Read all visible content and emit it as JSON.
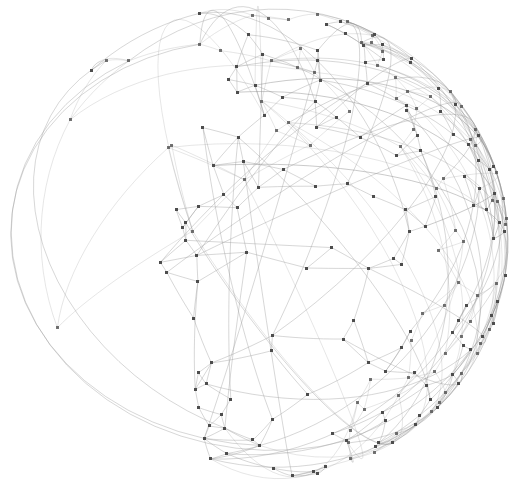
{
  "figure": {
    "title": "",
    "subtitle": "",
    "caption": "",
    "background_color": "#ffffff",
    "width": 516,
    "height": 491
  },
  "chart_data": {
    "type": "scatter",
    "title": "",
    "subtitle": "",
    "xlabel": "",
    "ylabel": "",
    "legend": [],
    "legend_position": "none",
    "grid": false,
    "axes_visible": false,
    "tick_labels_x": [],
    "tick_labels_y": [],
    "xlim": [
      0,
      516
    ],
    "ylim": [
      0,
      491
    ],
    "projection": "orthographic",
    "sphere": {
      "center_x": 259,
      "center_y": 243,
      "radius_x": 249,
      "radius_y": 237,
      "clipped_top": true,
      "clip_top_y": 0
    },
    "style": {
      "node_color": "#4d4d4d",
      "node_size_px": 3,
      "node_shape": "square",
      "edge_color": "#9a9a9a",
      "edge_width_px": 0.55,
      "edge_opacity": 0.72,
      "edge_curvature": "great-circle arc",
      "limb_edge_color": "#8a8a8a"
    },
    "counts": {
      "nodes": 214,
      "edges": 430
    },
    "sphere_points": [
      [
        0.72,
        0.34,
        0.6
      ],
      [
        -0.18,
        0.52,
        0.83
      ],
      [
        0.41,
        -0.66,
        0.63
      ],
      [
        -0.77,
        0.11,
        0.63
      ],
      [
        0.05,
        0.89,
        0.45
      ],
      [
        0.63,
        0.21,
        -0.75
      ],
      [
        -0.44,
        -0.38,
        0.81
      ],
      [
        0.88,
        -0.12,
        0.46
      ],
      [
        -0.29,
        0.74,
        -0.61
      ],
      [
        0.16,
        -0.93,
        0.33
      ],
      [
        -0.91,
        0.36,
        0.21
      ],
      [
        0.55,
        0.55,
        0.63
      ],
      [
        -0.61,
        -0.72,
        0.33
      ],
      [
        0.34,
        0.08,
        0.94
      ],
      [
        -0.05,
        -0.45,
        -0.89
      ],
      [
        0.79,
        0.58,
        0.2
      ],
      [
        -0.39,
        0.22,
        0.89
      ],
      [
        0.22,
        0.67,
        -0.71
      ],
      [
        -0.83,
        -0.25,
        0.5
      ],
      [
        0.68,
        -0.48,
        0.56
      ],
      [
        0.11,
        0.31,
        0.94
      ],
      [
        -0.52,
        0.81,
        0.26
      ],
      [
        0.93,
        0.13,
        0.34
      ],
      [
        -0.14,
        -0.77,
        0.62
      ],
      [
        0.47,
        0.86,
        -0.21
      ],
      [
        -0.66,
        0.44,
        0.61
      ],
      [
        0.28,
        -0.21,
        0.94
      ],
      [
        -0.97,
        0.05,
        0.24
      ],
      [
        0.59,
        -0.79,
        0.13
      ],
      [
        0.02,
        0.96,
        -0.28
      ],
      [
        -0.33,
        -0.59,
        0.74
      ],
      [
        0.81,
        0.41,
        -0.42
      ],
      [
        -0.72,
        0.63,
        0.29
      ],
      [
        0.39,
        0.47,
        0.79
      ],
      [
        -0.08,
        -0.15,
        0.99
      ],
      [
        0.66,
        0.72,
        0.21
      ],
      [
        -0.45,
        0.09,
        0.89
      ],
      [
        0.19,
        -0.56,
        0.81
      ],
      [
        -0.88,
        -0.44,
        0.18
      ],
      [
        0.51,
        0.18,
        0.84
      ],
      [
        -0.25,
        0.88,
        0.4
      ],
      [
        0.74,
        -0.31,
        0.6
      ],
      [
        0.08,
        0.42,
        -0.9
      ],
      [
        -0.58,
        -0.81,
        0.09
      ],
      [
        0.36,
        0.91,
        0.21
      ],
      [
        -0.95,
        0.27,
        0.16
      ],
      [
        0.62,
        -0.63,
        0.47
      ],
      [
        -0.11,
        0.67,
        0.73
      ],
      [
        0.85,
        0.05,
        -0.52
      ],
      [
        -0.41,
        -0.28,
        0.87
      ],
      [
        0.24,
        0.79,
        0.56
      ],
      [
        -0.69,
        0.19,
        0.7
      ],
      [
        0.44,
        -0.88,
        0.18
      ],
      [
        -0.02,
        -0.34,
        0.94
      ],
      [
        0.92,
        0.33,
        0.21
      ],
      [
        -0.31,
        0.52,
        0.79
      ],
      [
        0.57,
        0.67,
        -0.48
      ],
      [
        -0.79,
        -0.56,
        0.25
      ],
      [
        0.13,
        0.22,
        0.97
      ],
      [
        -0.51,
        0.77,
        0.38
      ],
      [
        0.71,
        -0.16,
        -0.68
      ],
      [
        -0.21,
        -0.91,
        0.36
      ],
      [
        0.33,
        0.61,
        0.72
      ],
      [
        -0.86,
        0.41,
        0.3
      ],
      [
        0.48,
        -0.45,
        0.75
      ],
      [
        0.06,
        0.93,
        0.36
      ],
      [
        -0.63,
        -0.13,
        0.77
      ],
      [
        0.77,
        0.52,
        0.37
      ],
      [
        -0.38,
        0.31,
        0.87
      ],
      [
        0.29,
        -0.72,
        0.63
      ],
      [
        -0.99,
        0.08,
        0.11
      ],
      [
        0.65,
        0.75,
        0.12
      ],
      [
        -0.17,
        -0.49,
        0.85
      ],
      [
        0.54,
        0.28,
        0.79
      ],
      [
        -0.74,
        0.66,
        0.14
      ],
      [
        0.41,
        0.88,
        -0.25
      ],
      [
        0.09,
        -0.82,
        0.56
      ],
      [
        -0.46,
        -0.67,
        0.58
      ],
      [
        0.83,
        -0.39,
        0.4
      ],
      [
        -0.26,
        0.96,
        0.09
      ],
      [
        0.68,
        0.12,
        0.72
      ],
      [
        -0.91,
        -0.31,
        0.27
      ],
      [
        0.18,
        0.48,
        0.86
      ],
      [
        -0.56,
        0.44,
        0.7
      ],
      [
        0.37,
        -0.33,
        0.87
      ],
      [
        0.01,
        0.71,
        -0.7
      ],
      [
        -0.82,
        0.52,
        0.23
      ],
      [
        0.59,
        -0.74,
        0.32
      ],
      [
        -0.12,
        -0.21,
        0.97
      ],
      [
        0.94,
        0.21,
        -0.27
      ],
      [
        -0.34,
        0.82,
        0.46
      ],
      [
        0.72,
        0.61,
        -0.33
      ],
      [
        -0.67,
        -0.46,
        0.58
      ],
      [
        0.21,
        0.94,
        0.26
      ],
      [
        0.45,
        -0.58,
        0.68
      ],
      [
        -0.89,
        0.18,
        0.42
      ],
      [
        0.14,
        -0.66,
        0.74
      ],
      [
        -0.48,
        0.12,
        0.87
      ],
      [
        0.86,
        0.44,
        0.26
      ],
      [
        -0.07,
        0.85,
        0.52
      ],
      [
        0.63,
        -0.22,
        0.74
      ],
      [
        -0.76,
        -0.62,
        0.18
      ],
      [
        0.31,
        0.35,
        0.88
      ],
      [
        -0.22,
        -0.88,
        0.42
      ],
      [
        0.52,
        0.82,
        0.24
      ],
      [
        -0.96,
        0.22,
        0.18
      ],
      [
        0.08,
        -0.38,
        0.92
      ],
      [
        0.79,
        -0.55,
        0.27
      ],
      [
        -0.43,
        0.69,
        0.58
      ],
      [
        0.26,
        0.14,
        0.96
      ],
      [
        -0.61,
        -0.77,
        0.18
      ],
      [
        0.91,
        -0.08,
        0.41
      ],
      [
        -0.15,
        0.58,
        0.8
      ],
      [
        0.47,
        0.71,
        -0.52
      ],
      [
        -0.84,
        -0.18,
        0.51
      ],
      [
        0.35,
        -0.91,
        0.22
      ],
      [
        0.02,
        0.26,
        0.97
      ],
      [
        -0.54,
        0.83,
        0.15
      ],
      [
        0.74,
        0.36,
        0.57
      ],
      [
        -0.29,
        -0.41,
        0.86
      ],
      [
        0.66,
        -0.68,
        0.33
      ],
      [
        -0.93,
        0.34,
        0.12
      ],
      [
        0.19,
        0.87,
        0.46
      ],
      [
        -0.39,
        -0.21,
        0.9
      ],
      [
        0.81,
        0.56,
        -0.18
      ],
      [
        -0.08,
        -0.95,
        0.31
      ],
      [
        0.58,
        0.05,
        0.81
      ],
      [
        -0.71,
        0.51,
        0.49
      ],
      [
        0.42,
        -0.48,
        0.77
      ],
      [
        -0.18,
        0.79,
        0.59
      ],
      [
        0.88,
        0.27,
        -0.39
      ],
      [
        -0.65,
        -0.69,
        0.32
      ],
      [
        0.11,
        0.63,
        0.77
      ],
      [
        -0.49,
        0.38,
        0.78
      ],
      [
        0.69,
        -0.41,
        0.59
      ],
      [
        0.04,
        -0.72,
        0.69
      ],
      [
        -0.97,
        -0.11,
        0.22
      ],
      [
        0.33,
        0.79,
        0.52
      ],
      [
        -0.27,
        -0.64,
        0.72
      ],
      [
        0.76,
        0.63,
        0.13
      ],
      [
        -0.58,
        0.09,
        0.81
      ],
      [
        0.23,
        -0.26,
        0.94
      ],
      [
        0.95,
        0.08,
        0.3
      ],
      [
        -0.36,
        0.91,
        0.21
      ],
      [
        0.61,
        0.44,
        0.66
      ],
      [
        -0.88,
        -0.41,
        0.23
      ],
      [
        0.16,
        0.09,
        0.98
      ],
      [
        -0.44,
        0.75,
        0.49
      ],
      [
        0.84,
        -0.29,
        0.46
      ],
      [
        -0.06,
        -0.58,
        0.81
      ],
      [
        0.51,
        0.85,
        -0.14
      ],
      [
        -0.79,
        0.44,
        0.42
      ],
      [
        0.29,
        -0.83,
        0.47
      ],
      [
        -0.21,
        0.34,
        0.92
      ],
      [
        0.92,
        0.38,
        -0.08
      ],
      [
        -0.69,
        -0.58,
        0.43
      ],
      [
        0.07,
        0.96,
        0.27
      ],
      [
        -0.53,
        -0.33,
        0.78
      ],
      [
        0.71,
        0.68,
        -0.19
      ],
      [
        0.38,
        -0.12,
        0.92
      ],
      [
        -0.94,
        0.29,
        0.17
      ],
      [
        0.12,
        -0.88,
        0.46
      ],
      [
        -0.41,
        0.61,
        0.68
      ],
      [
        0.64,
        0.22,
        -0.74
      ],
      [
        -0.82,
        -0.48,
        0.31
      ],
      [
        0.26,
        0.69,
        0.68
      ],
      [
        -0.13,
        -0.79,
        0.6
      ],
      [
        0.87,
        0.47,
        0.16
      ],
      [
        -0.61,
        0.71,
        0.35
      ],
      [
        0.44,
        0.33,
        0.83
      ],
      [
        0.01,
        -0.48,
        0.88
      ],
      [
        -0.99,
        0.12,
        0.08
      ],
      [
        0.56,
        -0.81,
        0.18
      ],
      [
        -0.31,
        0.23,
        0.92
      ],
      [
        0.78,
        0.58,
        -0.24
      ],
      [
        -0.74,
        -0.63,
        0.24
      ],
      [
        0.21,
        0.41,
        0.89
      ],
      [
        -0.47,
        0.87,
        0.15
      ],
      [
        0.93,
        -0.18,
        0.32
      ],
      [
        -0.09,
        0.69,
        0.72
      ],
      [
        0.67,
        -0.56,
        0.49
      ],
      [
        -0.86,
        0.36,
        0.36
      ],
      [
        0.34,
        -0.69,
        0.64
      ],
      [
        0.05,
        0.84,
        0.54
      ],
      [
        -0.65,
        -0.21,
        0.73
      ],
      [
        0.82,
        0.52,
        0.24
      ],
      [
        -0.24,
        -0.93,
        0.28
      ],
      [
        0.49,
        0.62,
        0.61
      ],
      [
        -0.91,
        -0.36,
        0.21
      ],
      [
        0.17,
        -0.34,
        0.92
      ],
      [
        0.73,
        0.11,
        0.67
      ],
      [
        -0.52,
        0.66,
        0.54
      ],
      [
        0.39,
        0.92,
        0.06
      ],
      [
        -0.04,
        -0.66,
        0.75
      ],
      [
        0.89,
        0.31,
        -0.34
      ],
      [
        -0.77,
        0.54,
        0.34
      ],
      [
        0.28,
        0.26,
        0.93
      ],
      [
        -0.36,
        -0.72,
        0.59
      ],
      [
        0.62,
        0.76,
        0.18
      ],
      [
        -0.96,
        0.16,
        0.23
      ],
      [
        0.46,
        -0.38,
        0.8
      ],
      [
        0.09,
        0.54,
        0.84
      ],
      [
        -0.71,
        -0.69,
        0.13
      ],
      [
        0.85,
        -0.44,
        0.29
      ],
      [
        -0.19,
        0.91,
        0.37
      ],
      [
        0.54,
        0.09,
        0.84
      ],
      [
        -0.83,
        -0.53,
        0.17
      ],
      [
        0.31,
        0.88,
        0.36
      ],
      [
        -0.14,
        -0.26,
        0.96
      ],
      [
        0.96,
        0.24,
        0.13
      ],
      [
        -0.58,
        0.79,
        0.21
      ],
      [
        0.69,
        -0.71,
        0.14
      ],
      [
        0.02,
        0.38,
        0.92
      ],
      [
        -0.42,
        -0.86,
        0.29
      ],
      [
        0.79,
        0.41,
        0.46
      ],
      [
        -0.27,
        0.48,
        0.83
      ]
    ]
  }
}
